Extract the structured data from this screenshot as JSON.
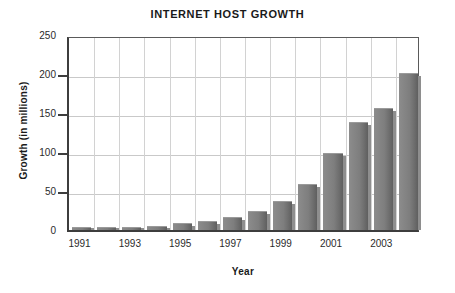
{
  "chart_data": {
    "type": "bar",
    "title": "INTERNET HOST GROWTH",
    "xlabel": "Year",
    "ylabel": "Growth (in millions)",
    "categories": [
      "1991",
      "1992",
      "1993",
      "1994",
      "1995",
      "1996",
      "1997",
      "1998",
      "1999",
      "2000",
      "2001",
      "2002",
      "2003",
      "2004"
    ],
    "values": [
      3,
      3,
      3,
      5,
      9,
      12,
      17,
      25,
      37,
      59,
      99,
      138,
      156,
      201
    ],
    "visible_tick_labels": [
      "1991",
      "1993",
      "1995",
      "1997",
      "1999",
      "2001",
      "2003"
    ],
    "ylim": [
      0,
      250
    ],
    "yticks": [
      0,
      50,
      100,
      150,
      200,
      250
    ],
    "ytick_labels": [
      "0",
      "50",
      "100",
      "150",
      "200",
      "250"
    ],
    "grid": "horizontal-and-vertical",
    "legend": "none",
    "bar_color": "#7e7e7e",
    "grid_color": "#c9c9c9",
    "axis_color": "#3d3d3d",
    "text_color": "#1a1a1a",
    "background": "#ffffff"
  }
}
